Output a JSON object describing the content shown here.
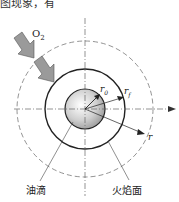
{
  "header_fragment": "图现象，有",
  "labels": {
    "oxygen": "O",
    "oxygen_sub": "2",
    "r0": "r",
    "r0_sub": "0",
    "rf": "r",
    "rf_sub": "f",
    "r": "r",
    "droplet": "油滴",
    "flame_surface": "火焰面"
  },
  "geometry": {
    "center": [
      85,
      109
    ],
    "droplet_radius": 20,
    "flame_radius": 40,
    "outer_dashed_radius": 68
  }
}
